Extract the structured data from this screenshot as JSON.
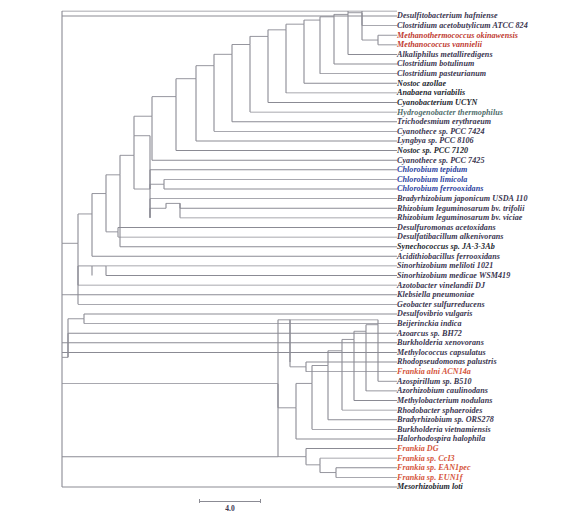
{
  "figure": {
    "type": "phylogenetic-tree",
    "layout": "rectangular-cladogram",
    "background_color": "#ffffff",
    "branch_color": "#8b8b94",
    "taxa_count": 43
  },
  "scale": {
    "label": "4.0",
    "bar_length_px": 62,
    "value": 4.0
  },
  "color_key": {
    "default": "#3a3550",
    "dark": "#231f2e",
    "red": "#c0392f",
    "blue": "#2b3f9e",
    "teal": "#4f6d6b",
    "orange": "#d4533a"
  },
  "taxa": [
    {
      "name": "Desulfitobacterium hafniense",
      "color": "default",
      "y": 19.0,
      "x": 389.0
    },
    {
      "name": "Clostridium acetobutylicum ATCC 824",
      "color": "default",
      "y": 30.8,
      "x": 389.0
    },
    {
      "name": "Methanothermococcus okinawensis",
      "color": "red",
      "y": 42.6,
      "x": 389.0
    },
    {
      "name": "Methanococcus vannielii",
      "color": "red",
      "y": 54.4,
      "x": 389.0
    },
    {
      "name": "Alkaliphilus metalliredigens",
      "color": "default",
      "y": 66.2,
      "x": 389.0
    },
    {
      "name": "Clostridium botulinum",
      "color": "default",
      "y": 78.0,
      "x": 389.0
    },
    {
      "name": "Clostridium pasteurianum",
      "color": "default",
      "y": 89.8,
      "x": 389.0
    },
    {
      "name": "Nostoc azollae",
      "color": "dark",
      "y": 101.6,
      "x": 389.0
    },
    {
      "name": "Anabaena variabilis",
      "color": "dark",
      "y": 113.4,
      "x": 389.0
    },
    {
      "name": "Cyanobacterium UCYN",
      "color": "dark",
      "y": 125.2,
      "x": 389.0
    },
    {
      "name": "Hydrogenobacter thermophilus",
      "color": "teal",
      "y": 137.0,
      "x": 389.0
    },
    {
      "name": "Trichodesmium erythraeum",
      "color": "default",
      "y": 148.8,
      "x": 389.0
    },
    {
      "name": "Cyanothece sp. PCC 7424",
      "color": "default",
      "y": 160.6,
      "x": 389.0
    },
    {
      "name": "Lyngbya sp. PCC 8106",
      "color": "default",
      "y": 172.4,
      "x": 389.0
    },
    {
      "name": "Nostoc sp. PCC 7120",
      "color": "dark",
      "y": 184.2,
      "x": 389.0
    },
    {
      "name": "Cyanothece sp. PCC 7425",
      "color": "default",
      "y": 196.0,
      "x": 389.0
    },
    {
      "name": "Chlorobium tepidum",
      "color": "blue",
      "y": 207.8,
      "x": 389.0
    },
    {
      "name": "Chlorobium limicola",
      "color": "blue",
      "y": 219.6,
      "x": 389.0
    },
    {
      "name": "Chlorobium ferrooxidans",
      "color": "blue",
      "y": 231.4,
      "x": 389.0
    },
    {
      "name": "Bradyrhizobium japonicum USDA 110",
      "color": "default",
      "y": 243.2,
      "x": 389.0
    },
    {
      "name": "Rhizobium leguminosarum bv. trifolii",
      "color": "default",
      "y": 255.0,
      "x": 389.0
    },
    {
      "name": "Rhizobium leguminosarum bv. viciae",
      "color": "default",
      "y": 266.8,
      "x": 389.0
    },
    {
      "name": "Desulfuromonas acetoxidans",
      "color": "default",
      "y": 278.6,
      "x": 389.0
    },
    {
      "name": "Desulfatibacillum alkenivorans",
      "color": "default",
      "y": 290.4,
      "x": 389.0
    },
    {
      "name": "Synechococcus sp. JA-3-3Ab",
      "color": "dark",
      "y": 302.2,
      "x": 389.0
    },
    {
      "name": "Acidithiobacillus ferrooxidans",
      "color": "default",
      "y": 314.0,
      "x": 389.0
    },
    {
      "name": "Sinorhizobium meliloti 1021",
      "color": "default",
      "y": 325.8,
      "x": 389.0
    },
    {
      "name": "Sinorhizobium medicae WSM419",
      "color": "default",
      "y": 337.6,
      "x": 389.0
    },
    {
      "name": "Azotobacter vinelandii DJ",
      "color": "default",
      "y": 349.4,
      "x": 389.0
    },
    {
      "name": "Klebsiella pneumoniae",
      "color": "default",
      "y": 361.2,
      "x": 389.0
    },
    {
      "name": "Geobacter sulfurreducens",
      "color": "default",
      "y": 373.0,
      "x": 389.0
    },
    {
      "name": "Desulfovibrio vulgaris",
      "color": "default",
      "y": 384.8,
      "x": 389.0
    },
    {
      "name": "Beijerinckia indica",
      "color": "default",
      "y": 396.6,
      "x": 389.0
    },
    {
      "name": "Azoarcus sp. BH72",
      "color": "default",
      "y": 408.4,
      "x": 389.0
    },
    {
      "name": "Burkholderia xenovorans",
      "color": "default",
      "y": 420.2,
      "x": 389.0
    },
    {
      "name": "Methylococcus capsulatus",
      "color": "default",
      "y": 432.0,
      "x": 389.0
    },
    {
      "name": "Rhodopseudomonas palustris",
      "color": "default",
      "y": 443.8,
      "x": 389.0
    },
    {
      "name": "Frankia alni ACN14a",
      "color": "orange",
      "y": 455.6,
      "x": 389.0
    },
    {
      "name": "Azospirillum sp. B510",
      "color": "default",
      "y": 467.4,
      "x": 389.0
    },
    {
      "name": "Azorhizobium caulinodans",
      "color": "default",
      "y": 479.2,
      "x": 389.0
    },
    {
      "name": "Methylobacterium nodulans",
      "color": "default",
      "y": 491.0,
      "x": 389.0
    },
    {
      "name": "Rhodobacter sphaeroides",
      "color": "default",
      "y": 502.8,
      "x": 389.0
    },
    {
      "name": "Bradyrhizobium sp. ORS278",
      "color": "default",
      "y": 514.6,
      "x": 389.0
    },
    {
      "name": "Burkholderia vietnamiensis",
      "color": "default",
      "y": 526.4,
      "x": 389.0
    },
    {
      "name": "Halorhodospira halophila",
      "color": "default",
      "y": 538.2,
      "x": 389.0
    },
    {
      "name": "Frankia DG",
      "color": "orange",
      "y": 550.0,
      "x": 389.0
    },
    {
      "name": "Frankia sp. CcI3",
      "color": "orange",
      "y": 561.8,
      "x": 389.0
    },
    {
      "name": "Frankia sp. EAN1pec",
      "color": "orange",
      "y": 573.6,
      "x": 389.0
    },
    {
      "name": "Frankia sp. EUN1f",
      "color": "orange",
      "y": 585.4,
      "x": 389.0
    },
    {
      "name": "Mesorhizobium loti",
      "color": "dark",
      "y": 597.2,
      "x": 389.0
    }
  ]
}
